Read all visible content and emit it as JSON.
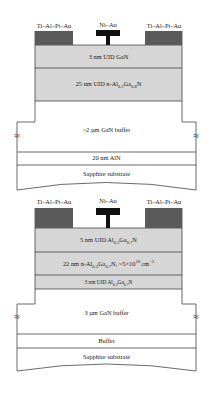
{
  "figure": {
    "top_stack": {
      "contacts": {
        "source": "Ti–Al–Pt–Au",
        "gate": "Ni–Au",
        "drain": "Ti–Al–Pt–Au"
      },
      "layers": [
        {
          "id": "cap",
          "label": "3 nm UID GaN",
          "fill": "#d6d6d6"
        },
        {
          "id": "barrier",
          "label_pre": "25 nm UID n-Al",
          "x_sub": "0.2",
          "label_mid": "Ga",
          "y_sub": "0.8",
          "label_post": "N",
          "fill": "#d6d6d6"
        },
        {
          "id": "buffer",
          "label": "~2 µm GaN buffer",
          "fill": "#ffffff"
        },
        {
          "id": "nucleation",
          "label": "20 nm AlN",
          "fill": "#ffffff"
        },
        {
          "id": "substrate",
          "label": "Sapphire substrate",
          "fill": "#ffffff"
        }
      ],
      "break_symbol": "≈"
    },
    "bottom_stack": {
      "contacts": {
        "source": "Ti–Al–Pt–Au",
        "gate": "Ni–Au",
        "drain": "Ti–Al–Pt–Au"
      },
      "layers": [
        {
          "id": "cap",
          "label_pre": "5 nm UID Al",
          "x_sub": "0.3",
          "label_mid": "Ga",
          "y_sub": "0.7",
          "label_post": "N",
          "fill": "#d6d6d6"
        },
        {
          "id": "doped-barrier",
          "label_pre": "22 nm n-Al",
          "x_sub": "0.3",
          "label_mid": "Ga",
          "y_sub": "0.7",
          "label_post": "N, ~5×10",
          "exp": "18",
          "label_unit": " cm",
          "unit_exp": "−3",
          "fill": "#d6d6d6"
        },
        {
          "id": "spacer",
          "label_pre": "3 nm UID Al",
          "x_sub": "0.3",
          "label_mid": "Ga",
          "y_sub": "0.7",
          "label_post": "N",
          "fill": "#d6d6d6"
        },
        {
          "id": "buffer",
          "label": "3 µm GaN buffer",
          "fill": "#ffffff"
        },
        {
          "id": "nucleation",
          "label": "Buffer",
          "fill": "#ffffff"
        },
        {
          "id": "substrate",
          "label": "Sapphire substrate",
          "fill": "#ffffff"
        }
      ],
      "break_symbol": "≈"
    },
    "colors": {
      "contact": "#5a5a5a",
      "gate": "#111111",
      "barrier": "#d6d6d6",
      "line": "#444444"
    }
  }
}
